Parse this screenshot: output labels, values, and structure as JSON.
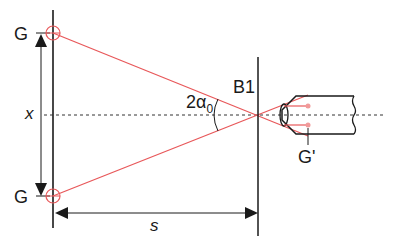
{
  "diagram": {
    "type": "optical-geometry",
    "labels": {
      "object_top": "G",
      "object_bottom": "G",
      "height": "x",
      "distance": "s",
      "aperture": "B1",
      "angle": "2α",
      "angle_subscript": "0",
      "image": "G'"
    },
    "colors": {
      "ray": "#e8585a",
      "line": "#1a1a1a",
      "source": "#e8585a"
    }
  }
}
